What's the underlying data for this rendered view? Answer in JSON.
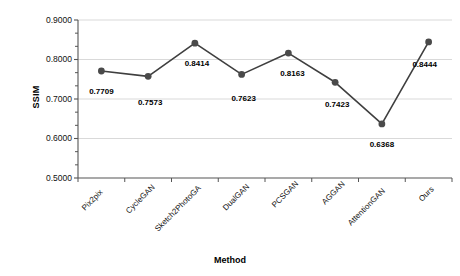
{
  "chart_data": {
    "type": "line",
    "title": "",
    "xlabel": "Method",
    "ylabel": "SSIM",
    "categories": [
      "Pix2pix",
      "CycleGAN",
      "Sketch2PhotoGA",
      "DualGAN",
      "PCSGAN",
      "AGGAN",
      "AttentionGAN",
      "Ours"
    ],
    "values": [
      0.7709,
      0.7573,
      0.8414,
      0.7623,
      0.8163,
      0.7423,
      0.6368,
      0.8444
    ],
    "point_labels": [
      "0.7709",
      "0.7573",
      "0.8414",
      "0.7623",
      "0.8163",
      "0.7423",
      "0.6368",
      "0.8444"
    ],
    "ylim": [
      0.5,
      0.9
    ],
    "ytick_labels": [
      "0.9000",
      "0.8000",
      "0.7000",
      "0.6000",
      "0.5000"
    ],
    "ytick_values": [
      0.9,
      0.8,
      0.7,
      0.6,
      0.5
    ],
    "minor_ticks_per_interval": 2,
    "grid": "horizontal",
    "legend": "none",
    "series_name": "SSIM",
    "colors": {
      "line": "#3f3f3f",
      "marker": "#4a4a4a",
      "grid": "#d9d9d9",
      "axis": "#555555",
      "text": "#111111"
    }
  }
}
